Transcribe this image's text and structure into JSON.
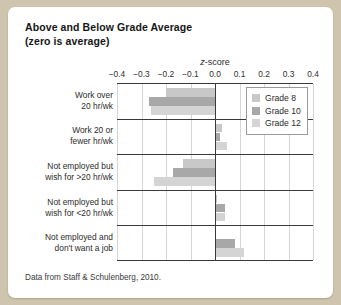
{
  "card": {
    "title_line1": "Above and Below Grade Average",
    "title_line2": "(zero is average)",
    "footer": "Data from Staff & Schulenberg, 2010."
  },
  "axis_title_italic": "z",
  "axis_title_rest": "-score",
  "colors": {
    "background": "#cfc4ad",
    "card": "#ffffff",
    "axis": "#3a3a3a",
    "grid": "#d6d6d6",
    "grade8": "#c8c8c8",
    "grade10": "#a8a8a8",
    "grade12": "#d4d4d4"
  },
  "legend": {
    "position": "top-right",
    "items": [
      {
        "label": "Grade 8",
        "color": "#c8c8c8"
      },
      {
        "label": "Grade 10",
        "color": "#a8a8a8"
      },
      {
        "label": "Grade 12",
        "color": "#d4d4d4"
      }
    ]
  },
  "chart_data": {
    "type": "bar",
    "orientation": "horizontal",
    "title": "Above and Below Grade Average (zero is average)",
    "xlabel": "z-score",
    "ylabel": "",
    "xlim": [
      -0.4,
      0.4
    ],
    "xticks": [
      -0.4,
      -0.3,
      -0.2,
      -0.1,
      0.0,
      0.1,
      0.2,
      0.3,
      0.4
    ],
    "xticklabels": [
      "−0.4",
      "−0.3",
      "−0.2",
      "−0.1",
      "0.0",
      "0.1",
      "0.2",
      "0.3",
      "0.4"
    ],
    "grid": true,
    "zero_reference": 0.0,
    "categories": [
      "Work over 20 hr/wk",
      "Work 20 or fewer hr/wk",
      "Not employed but wish for >20 hr/wk",
      "Not employed but wish for <20 hr/wk",
      "Not employed and don't want a job"
    ],
    "series": [
      {
        "name": "Grade 8",
        "color": "#c8c8c8",
        "values": [
          -0.2,
          0.03,
          -0.13,
          0.01,
          0.0
        ]
      },
      {
        "name": "Grade 10",
        "color": "#a8a8a8",
        "values": [
          -0.27,
          0.02,
          -0.17,
          0.04,
          0.08
        ]
      },
      {
        "name": "Grade 12",
        "color": "#d4d4d4",
        "values": [
          -0.26,
          0.05,
          -0.25,
          0.04,
          0.12
        ]
      }
    ],
    "annotations": [
      "Data from Staff & Schulenberg, 2010."
    ]
  }
}
